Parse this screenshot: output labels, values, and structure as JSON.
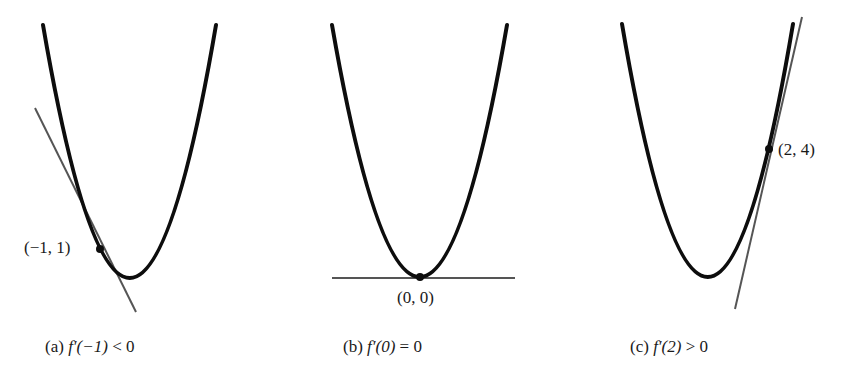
{
  "figure": {
    "panels": [
      {
        "id": "a",
        "caption_prefix": "(a)",
        "caption_func": "f′(−1)",
        "caption_rel": "< 0",
        "point_label": "(−1, 1)",
        "point": {
          "x": -1,
          "y": 1
        },
        "slope_sign": "negative",
        "derivative": -2
      },
      {
        "id": "b",
        "caption_prefix": "(b)",
        "caption_func": "f′(0)",
        "caption_rel": "= 0",
        "point_label": "(0, 0)",
        "point": {
          "x": 0,
          "y": 0
        },
        "slope_sign": "zero",
        "derivative": 0
      },
      {
        "id": "c",
        "caption_prefix": "(c)",
        "caption_func": "f′(2)",
        "caption_rel": "> 0",
        "point_label": "(2, 4)",
        "point": {
          "x": 2,
          "y": 4
        },
        "slope_sign": "positive",
        "derivative": 4
      }
    ],
    "colors": {
      "curve": "#0d0d0d",
      "tangent": "#555555",
      "background": "#ffffff"
    }
  }
}
